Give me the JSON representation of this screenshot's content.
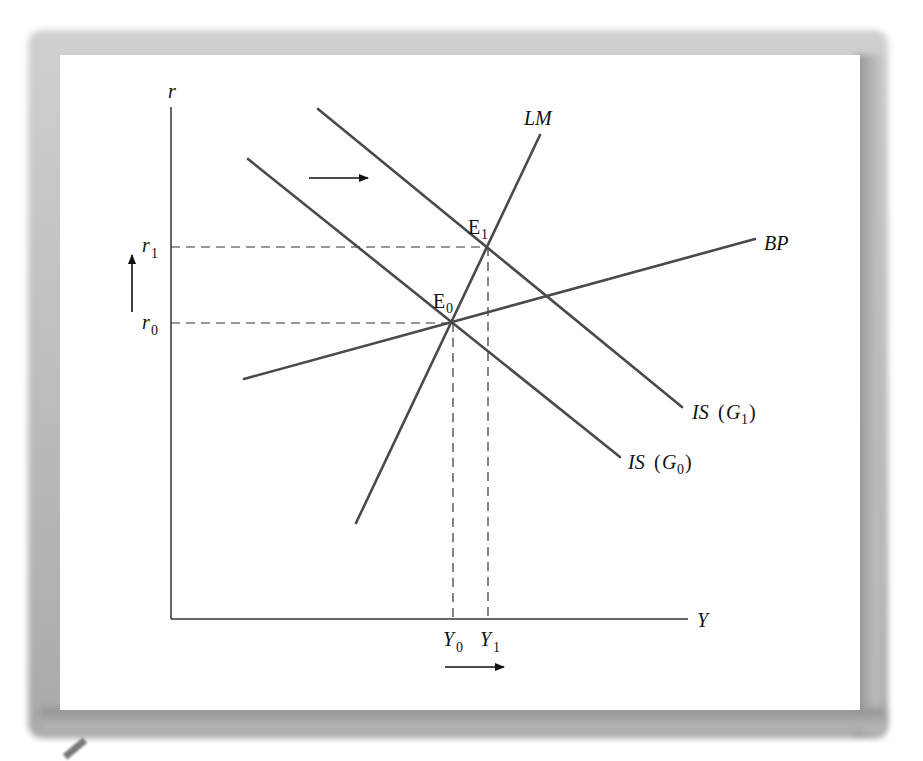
{
  "figure": {
    "type": "IS-LM-BP diagram"
  },
  "axes": {
    "y_label": "r",
    "x_label": "Y"
  },
  "curves": {
    "lm": {
      "label": "LM"
    },
    "bp": {
      "label": "BP"
    },
    "is_g0": {
      "label_main": "IS",
      "label_paren_open": "(",
      "label_var": "G",
      "label_sub": "0",
      "label_paren_close": ")"
    },
    "is_g1": {
      "label_main": "IS",
      "label_paren_open": "(",
      "label_var": "G",
      "label_sub": "1",
      "label_paren_close": ")"
    }
  },
  "equilibria": {
    "e0": {
      "base": "E",
      "sub": "0"
    },
    "e1": {
      "base": "E",
      "sub": "1"
    }
  },
  "ticks": {
    "r0": {
      "base": "r",
      "sub": "0"
    },
    "r1": {
      "base": "r",
      "sub": "1"
    },
    "y0": {
      "base": "Y",
      "sub": "0"
    },
    "y1": {
      "base": "Y",
      "sub": "1"
    }
  },
  "arrows": {
    "is_shift": "right",
    "r_change": "up",
    "y_change": "right"
  },
  "colors": {
    "curve": "#4a4a4a",
    "axis": "#333333",
    "text": "#111111",
    "frame": "#b0b0b0"
  }
}
